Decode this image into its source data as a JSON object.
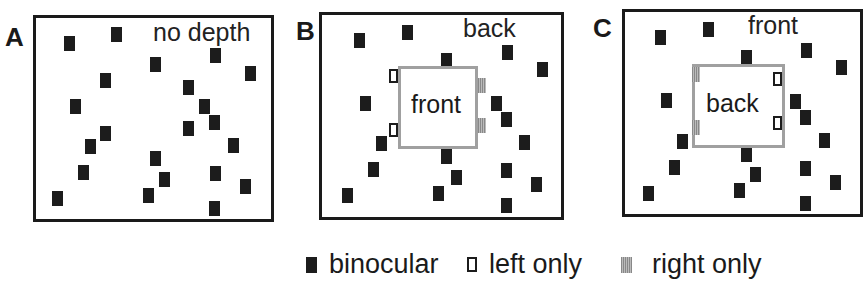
{
  "panels": [
    {
      "id": "A",
      "label": "A",
      "title": "no depth"
    },
    {
      "id": "B",
      "label": "B",
      "title": "back",
      "inner_label": "front"
    },
    {
      "id": "C",
      "label": "C",
      "title": "front",
      "inner_label": "back"
    }
  ],
  "legend": {
    "binocular": "binocular",
    "left_only": "left only",
    "right_only": "right only"
  },
  "colors": {
    "binocular": "#1c1c1c",
    "right_only": "#9a9a9a",
    "inner_box_border": "#a0a0a0"
  }
}
